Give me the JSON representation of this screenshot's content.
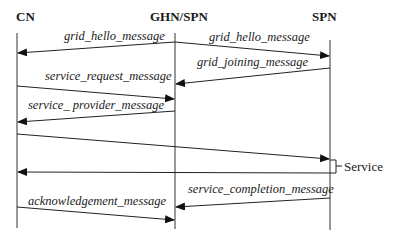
{
  "diagram": {
    "type": "sequence",
    "actors": [
      {
        "id": "cn",
        "label": "CN"
      },
      {
        "id": "ghn",
        "label": "GHN/SPN"
      },
      {
        "id": "spn",
        "label": "SPN"
      }
    ],
    "messages": [
      {
        "from": "GHN/SPN",
        "to": "CN",
        "label": "grid_hello_message"
      },
      {
        "from": "GHN/SPN",
        "to": "SPN",
        "label": "grid_hello_message"
      },
      {
        "from": "SPN",
        "to": "GHN/SPN",
        "label": "grid_joining_message"
      },
      {
        "from": "CN",
        "to": "GHN/SPN",
        "label": "service_request_message"
      },
      {
        "from": "GHN/SPN",
        "to": "CN",
        "label": "service_ provider_message"
      },
      {
        "from": "CN",
        "to": "SPN",
        "label": ""
      },
      {
        "from": "SPN",
        "to": "CN",
        "label": ""
      },
      {
        "from": "SPN",
        "to": "GHN/SPN",
        "label": "service_completion_message"
      },
      {
        "from": "CN",
        "to": "GHN/SPN",
        "label": "acknowledgement_message"
      }
    ],
    "note": {
      "on": "SPN",
      "label": "Service"
    }
  },
  "colors": {
    "line": "#222222",
    "background": "#ffffff"
  }
}
